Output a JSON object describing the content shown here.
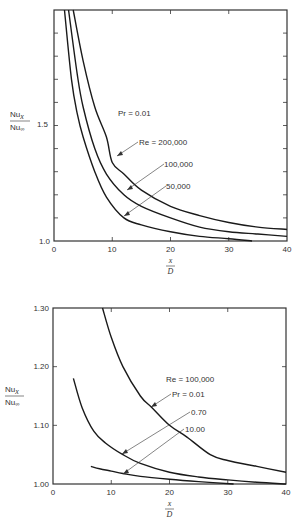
{
  "chart_data": [
    {
      "type": "line",
      "title": "",
      "xlabel": "x/D",
      "ylabel": "Nu_x / Nu_∞",
      "xlim": [
        0,
        40
      ],
      "ylim": [
        1.0,
        2.0
      ],
      "xticks": [
        0,
        10,
        20,
        30,
        40
      ],
      "yticks_labeled": [
        1.0,
        1.5
      ],
      "grid": false,
      "annotations": [
        "Pr = 0.01"
      ],
      "series": [
        {
          "name": "Re = 200,000",
          "x": [
            3.3,
            5,
            7,
            9,
            10,
            12,
            15,
            20,
            25,
            30,
            35,
            40
          ],
          "y": [
            2.0,
            1.78,
            1.58,
            1.45,
            1.34,
            1.29,
            1.22,
            1.15,
            1.11,
            1.08,
            1.06,
            1.05
          ]
        },
        {
          "name": "100,000",
          "x": [
            2.5,
            4,
            5,
            7,
            9,
            12,
            15,
            20,
            25,
            30,
            35,
            40
          ],
          "y": [
            2.0,
            1.72,
            1.58,
            1.4,
            1.29,
            1.2,
            1.15,
            1.1,
            1.06,
            1.04,
            1.03,
            1.02
          ]
        },
        {
          "name": "50,000",
          "x": [
            1.8,
            3,
            4,
            5,
            7,
            9,
            12,
            15,
            20,
            25,
            30,
            34
          ],
          "y": [
            2.0,
            1.7,
            1.55,
            1.45,
            1.3,
            1.19,
            1.1,
            1.07,
            1.04,
            1.02,
            1.01,
            1.0
          ]
        }
      ],
      "labels": {
        "x_tick": [
          "0",
          "10",
          "20",
          "30",
          "40"
        ],
        "y_tick": [
          "1.0",
          "1.5"
        ],
        "series": [
          "Re = 200,000",
          "100,000",
          "50,000"
        ],
        "pr": "Pr = 0.01",
        "ylabel_num": "Nu",
        "ylabel_num_sub": "x",
        "ylabel_den": "Nu",
        "ylabel_den_sub": "∞",
        "xlabel_num": "x",
        "xlabel_den": "D"
      }
    },
    {
      "type": "line",
      "title": "",
      "xlabel": "x/D",
      "ylabel": "Nu_x / Nu_∞",
      "xlim": [
        0,
        40
      ],
      "ylim": [
        1.0,
        1.3
      ],
      "xticks": [
        0,
        10,
        20,
        30,
        40
      ],
      "yticks_labeled": [
        1.0,
        1.1,
        1.2,
        1.3
      ],
      "grid": false,
      "annotations": [
        "Re = 100,000"
      ],
      "series": [
        {
          "name": "Pr = 0.01",
          "x": [
            8.5,
            10,
            12,
            15,
            17,
            20,
            23,
            27,
            30,
            35,
            40
          ],
          "y": [
            1.3,
            1.25,
            1.2,
            1.15,
            1.13,
            1.1,
            1.08,
            1.05,
            1.04,
            1.03,
            1.02
          ]
        },
        {
          "name": "0.70",
          "x": [
            3.5,
            5,
            7,
            9,
            12,
            15,
            20,
            25,
            30,
            35,
            40
          ],
          "y": [
            1.18,
            1.13,
            1.09,
            1.07,
            1.05,
            1.035,
            1.02,
            1.012,
            1.007,
            1.003,
            1.0
          ]
        },
        {
          "name": "10.00",
          "x": [
            6.5,
            8,
            10,
            12,
            15,
            20,
            25,
            31
          ],
          "y": [
            1.03,
            1.026,
            1.022,
            1.018,
            1.013,
            1.008,
            1.004,
            1.0
          ]
        }
      ],
      "labels": {
        "x_tick": [
          "0",
          "10",
          "20",
          "30",
          "40"
        ],
        "y_tick": [
          "1.00",
          "1.10",
          "1.20",
          "1.30"
        ],
        "series": [
          "Pr = 0.01",
          "0.70",
          "10.00"
        ],
        "re": "Re = 100,000",
        "ylabel_num": "Nu",
        "ylabel_num_sub": "x",
        "ylabel_den": "Nu",
        "ylabel_den_sub": "∞",
        "xlabel_num": "x",
        "xlabel_den": "D"
      }
    }
  ]
}
